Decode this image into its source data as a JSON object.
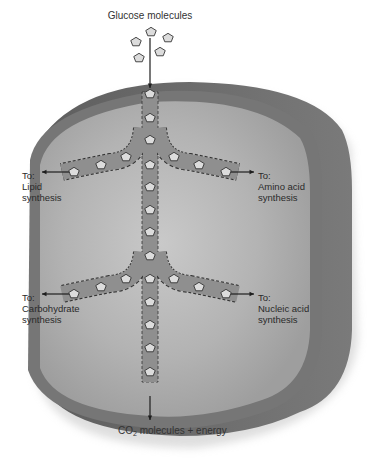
{
  "title": "Glucose molecules",
  "pathways": [
    {
      "id": "lipid",
      "to": "To:",
      "line1": "Lipid",
      "line2": "synthesis"
    },
    {
      "id": "amino",
      "to": "To:",
      "line1": "Amino acid",
      "line2": "synthesis"
    },
    {
      "id": "carb",
      "to": "To:",
      "line1": "Carbohydrate",
      "line2": "synthesis"
    },
    {
      "id": "nucleic",
      "to": "To:",
      "line1": "Nucleic acid",
      "line2": "synthesis"
    }
  ],
  "output": {
    "prefix": "CO",
    "subscript": "2",
    "suffix": " molecules + energy"
  },
  "colors": {
    "membrane_outer": "#6e6e6e",
    "membrane_inner": "#8a8a8a",
    "cytoplasm": "#b8b8b8",
    "channel": "#8f8f8f",
    "molecule": "#dcdcdc",
    "ink": "#1e1e1e"
  }
}
